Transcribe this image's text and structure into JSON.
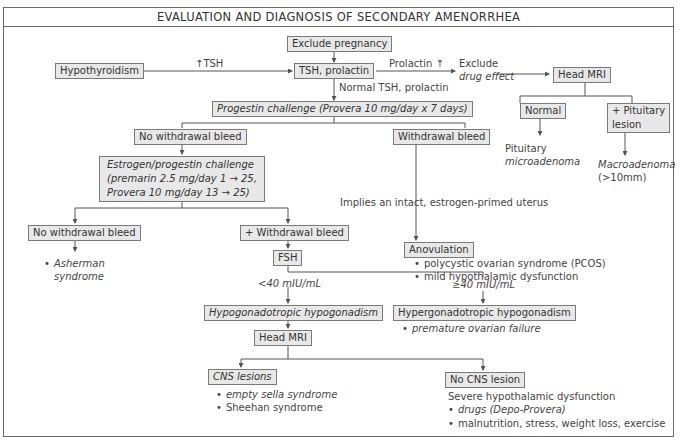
{
  "title": "EVALUATION AND DIAGNOSIS OF SECONDARY AMENORRHEA",
  "nodes": {
    "exclude_pregnancy": "Exclude pregnancy",
    "tsh_prolactin": "TSH, prolactin",
    "hypothyroidism": "Hypothyroidism",
    "high_tsh_label": "↑TSH",
    "prolactin_high_label": "Prolactin ↑",
    "exclude_drug_effect_1": "Exclude",
    "exclude_drug_effect_2": "drug effect",
    "head_mri_top": "Head MRI",
    "normal": "Normal",
    "pituitary_lesion_1": "+ Pituitary",
    "pituitary_lesion_2": "lesion",
    "pituitary_microadenoma_1": "Pituitary",
    "pituitary_microadenoma_2": "microadenoma",
    "macroadenoma_1": "Macroadenoma",
    "macroadenoma_2": "(>10mm)",
    "normal_tsh_prolactin": "Normal TSH, prolactin",
    "progestin_challenge": "Progestin challenge (Provera 10 mg/day x 7 days)",
    "no_withdrawal_bleed_1": "No withdrawal bleed",
    "withdrawal_bleed": "Withdrawal bleed",
    "ep_challenge_1": "Estrogen/progestin challenge",
    "ep_challenge_2": "(premarin 2.5 mg/day 1 → 25,",
    "ep_challenge_3": "Provera 10 mg/day 13 → 25)",
    "implies_uterus": "Implies an intact, estrogen-primed uterus",
    "anovulation": "Anovulation",
    "anovulation_items": [
      "polycystic ovarian syndrome (PCOS)",
      "mild hypothalamic dysfunction"
    ],
    "no_withdrawal_bleed_2": "No withdrawal bleed",
    "plus_withdrawal_bleed": "+ Withdrawal bleed",
    "asherman_1": "Asherman",
    "asherman_2": "syndrome",
    "fsh": "FSH",
    "fsh_low_label": "<40 mIU/mL",
    "fsh_high_label": "≥40 mIU/mL",
    "hypogonadotropic": "Hypogonadotropic hypogonadism",
    "hypergonadotropic": "Hypergonadotropic hypogonadism",
    "hypergonadotropic_items": [
      "premature ovarian failure"
    ],
    "head_mri_bottom": "Head MRI",
    "cns_lesions": "CNS lesions",
    "cns_lesions_items": [
      "empty sella syndrome",
      "Sheehan syndrome"
    ],
    "no_cns_lesion": "No CNS lesion",
    "severe_hypothalamic": "Severe hypothalamic dysfunction",
    "no_cns_items": [
      "drugs (Depo-Provera)",
      "malnutrition, stress, weight loss, exercise"
    ]
  },
  "colors": {
    "box_fill": "#e8e8e8",
    "box_border": "#7a7a7a",
    "line": "#555555"
  }
}
